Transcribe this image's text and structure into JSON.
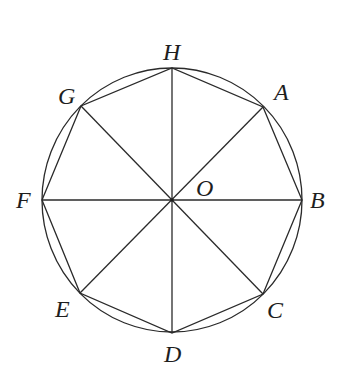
{
  "figure": {
    "center": {
      "label": "O",
      "x": 172,
      "y": 200
    },
    "circle": {
      "cx": 172,
      "cy": 200,
      "rx": 130,
      "ry": 132
    },
    "vertices": [
      {
        "label": "A",
        "x": 263,
        "y": 107,
        "lx": 274,
        "ly": 100
      },
      {
        "label": "B",
        "x": 302,
        "y": 200,
        "lx": 310,
        "ly": 208
      },
      {
        "label": "C",
        "x": 263,
        "y": 294,
        "lx": 267,
        "ly": 318
      },
      {
        "label": "D",
        "x": 172,
        "y": 333,
        "lx": 164,
        "ly": 362
      },
      {
        "label": "E",
        "x": 80,
        "y": 293,
        "lx": 55,
        "ly": 317
      },
      {
        "label": "F",
        "x": 42,
        "y": 200,
        "lx": 16,
        "ly": 208
      },
      {
        "label": "G",
        "x": 81,
        "y": 106,
        "lx": 58,
        "ly": 104
      },
      {
        "label": "H",
        "x": 172,
        "y": 68,
        "lx": 163,
        "ly": 60
      }
    ],
    "o_label": {
      "label": "O",
      "lx": 196,
      "ly": 196
    },
    "polygon_order": [
      "A",
      "B",
      "C",
      "D",
      "E",
      "F",
      "G",
      "H"
    ],
    "diameters": [
      [
        "A",
        "E"
      ],
      [
        "B",
        "F"
      ],
      [
        "C",
        "G"
      ],
      [
        "D",
        "H"
      ]
    ],
    "colors": {
      "stroke": "#2a2a2a",
      "text": "#1e1e1e",
      "background": "#ffffff"
    }
  }
}
